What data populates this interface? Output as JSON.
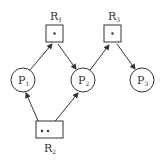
{
  "diagram": {
    "type": "resource-allocation-graph",
    "processes": [
      {
        "id": "P1",
        "label": "P",
        "sub": "1",
        "cx": 23,
        "cy": 80
      },
      {
        "id": "P2",
        "label": "P",
        "sub": "2",
        "cx": 83,
        "cy": 80
      },
      {
        "id": "P3",
        "label": "P",
        "sub": "3",
        "cx": 142,
        "cy": 80
      }
    ],
    "resources": [
      {
        "id": "R1",
        "label": "R",
        "sub": "1",
        "instances": 1
      },
      {
        "id": "R2",
        "label": "R",
        "sub": "2",
        "instances": 2
      },
      {
        "id": "R3",
        "label": "R",
        "sub": "3",
        "instances": 1
      }
    ],
    "edges": [
      {
        "from": "P1",
        "to": "R1",
        "kind": "request"
      },
      {
        "from": "R1",
        "to": "P2",
        "kind": "assignment"
      },
      {
        "from": "P2",
        "to": "R3",
        "kind": "request"
      },
      {
        "from": "R3",
        "to": "P3",
        "kind": "assignment"
      },
      {
        "from": "R2",
        "to": "P1",
        "kind": "assignment"
      },
      {
        "from": "R2",
        "to": "P2",
        "kind": "assignment"
      }
    ],
    "colors": {
      "stroke": "#333333",
      "background": "#ffffff"
    }
  }
}
